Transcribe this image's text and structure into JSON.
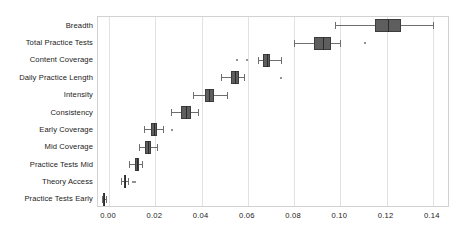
{
  "chart_data": {
    "type": "boxplot",
    "title": "",
    "xlabel": "",
    "ylabel": "",
    "orientation": "horizontal",
    "xlim": [
      -0.0048,
      0.1474
    ],
    "xticks": [
      0.0,
      0.02,
      0.04,
      0.06,
      0.08,
      0.1,
      0.12,
      0.14
    ],
    "xticklabels": [
      "0.00",
      "0.02",
      "0.04",
      "0.06",
      "0.08",
      "0.10",
      "0.12",
      "0.14"
    ],
    "grid": "vertical",
    "legend": "none",
    "box_color": "#5e5e5e",
    "line_color": "#6e6e6e",
    "categories": [
      "Breadth",
      "Total Practice Tests",
      "Content Coverage",
      "Daily Practice Length",
      "Intensity",
      "Consistency",
      "Early Coverage",
      "Mid Coverage",
      "Practice Tests Mid",
      "Theory Access",
      "Practice Tests Early"
    ],
    "boxes": [
      {
        "category": "Breadth",
        "whisker_low": 0.0975,
        "q1": 0.1148,
        "median": 0.1205,
        "q3": 0.1262,
        "whisker_high": 0.14,
        "outliers": []
      },
      {
        "category": "Total Practice Tests",
        "whisker_low": 0.08,
        "q1": 0.0885,
        "median": 0.0925,
        "q3": 0.0958,
        "whisker_high": 0.1,
        "outliers": [
          0.1105
        ]
      },
      {
        "category": "Content Coverage",
        "whisker_low": 0.0645,
        "q1": 0.0665,
        "median": 0.0682,
        "q3": 0.0697,
        "whisker_high": 0.0742,
        "outliers": [
          0.0555,
          0.0598
        ]
      },
      {
        "category": "Daily Practice Length",
        "whisker_low": 0.0482,
        "q1": 0.0527,
        "median": 0.0543,
        "q3": 0.056,
        "whisker_high": 0.0585,
        "outliers": [
          0.0742
        ]
      },
      {
        "category": "Intensity",
        "whisker_low": 0.0362,
        "q1": 0.0413,
        "median": 0.043,
        "q3": 0.0452,
        "whisker_high": 0.051,
        "outliers": []
      },
      {
        "category": "Consistency",
        "whisker_low": 0.0268,
        "q1": 0.0312,
        "median": 0.0332,
        "q3": 0.0355,
        "whisker_high": 0.0385,
        "outliers": []
      },
      {
        "category": "Early Coverage",
        "whisker_low": 0.0153,
        "q1": 0.0183,
        "median": 0.0192,
        "q3": 0.0205,
        "whisker_high": 0.0232,
        "outliers": [
          0.0272
        ]
      },
      {
        "category": "Mid Coverage",
        "whisker_low": 0.013,
        "q1": 0.0155,
        "median": 0.0168,
        "q3": 0.018,
        "whisker_high": 0.0205,
        "outliers": []
      },
      {
        "category": "Practice Tests Mid",
        "whisker_low": 0.0088,
        "q1": 0.011,
        "median": 0.012,
        "q3": 0.0128,
        "whisker_high": 0.0142,
        "outliers": []
      },
      {
        "category": "Theory Access",
        "whisker_low": 0.0052,
        "q1": 0.0065,
        "median": 0.007,
        "q3": 0.0075,
        "whisker_high": 0.008,
        "outliers": [
          0.0102,
          0.0112
        ]
      },
      {
        "category": "Practice Tests Early",
        "whisker_low": -0.0032,
        "q1": -0.0026,
        "median": -0.0023,
        "q3": -0.002,
        "whisker_high": -0.0014,
        "outliers": []
      }
    ]
  }
}
